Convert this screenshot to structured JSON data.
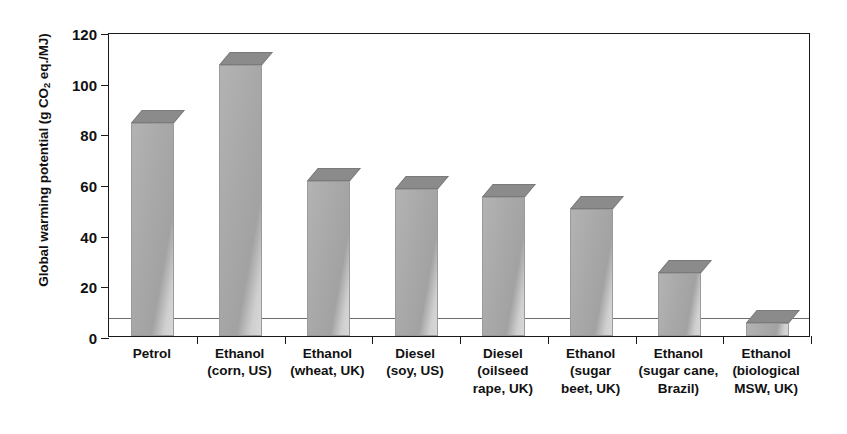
{
  "chart_data": {
    "type": "bar",
    "title": "",
    "xlabel": "",
    "ylabel": "Global warming potential (g CO2 eq./MJ)",
    "ylabel_parts": {
      "pre": "Global warming potential (g CO",
      "sub": "2",
      "post": " eq./MJ)"
    },
    "ylim": [
      0,
      120
    ],
    "yticks": [
      0,
      20,
      40,
      60,
      80,
      100,
      120
    ],
    "ytick_labels": [
      "0",
      "20",
      "40",
      "60",
      "80",
      "100",
      "120"
    ],
    "grid": false,
    "legend": "none",
    "categories": [
      "Petrol",
      "Ethanol (corn, US)",
      "Ethanol (wheat, UK)",
      "Diesel (soy, US)",
      "Diesel (oilseed rape, UK)",
      "Ethanol (sugar beet, UK)",
      "Ethanol (sugar cane, Brazil)",
      "Ethanol (biological MSW, UK)"
    ],
    "category_lines": [
      [
        "Petrol"
      ],
      [
        "Ethanol",
        "(corn, US)"
      ],
      [
        "Ethanol",
        "(wheat, UK)"
      ],
      [
        "Diesel",
        "(soy, US)"
      ],
      [
        "Diesel",
        "(oilseed",
        "rape, UK)"
      ],
      [
        "Ethanol",
        "(sugar",
        "beet, UK)"
      ],
      [
        "Ethanol",
        "(sugar cane,",
        "Brazil)"
      ],
      [
        "Ethanol",
        "(biological",
        "MSW, UK)"
      ]
    ],
    "values": [
      84,
      107,
      61,
      58,
      55,
      50,
      25,
      5
    ],
    "annotations": [
      {
        "type": "reference-line",
        "orientation": "horizontal",
        "value": 8,
        "label": ""
      }
    ],
    "style": {
      "bar_front_color": "#a9a9a9",
      "bar_top_color": "#8b8b8b",
      "bar_side_color": "#d4d4d4",
      "axis_color": "#1a1a1a",
      "reference_line_color": "#6d6d6d",
      "background": "#ffffff",
      "three_d": true
    }
  }
}
